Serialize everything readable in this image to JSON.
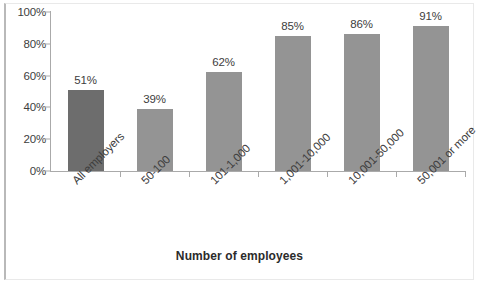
{
  "chart_data": {
    "type": "bar",
    "title": "",
    "xlabel": "Number of employees",
    "ylabel": "",
    "categories": [
      "All employers",
      "50-100",
      "101-1,000",
      "1,001-10,000",
      "10,001-50,000",
      "50,001 or more"
    ],
    "values": [
      51,
      39,
      62,
      85,
      86,
      91
    ],
    "value_labels": [
      "51%",
      "39%",
      "62%",
      "85%",
      "86%",
      "91%"
    ],
    "ylim": [
      0,
      100
    ],
    "ytick_labels": [
      "0%",
      "20%",
      "40%",
      "60%",
      "80%",
      "100%"
    ],
    "ytick_values": [
      0,
      20,
      40,
      60,
      80,
      100
    ],
    "grid": false,
    "legend": "none",
    "series": [
      {
        "name": "Percent",
        "values": [
          51,
          39,
          62,
          85,
          86,
          91
        ]
      }
    ],
    "bar_colors": [
      "#6d6d6d",
      "#949494",
      "#949494",
      "#949494",
      "#949494",
      "#949494"
    ],
    "highlight_category": "All employers"
  },
  "colors": {
    "bar_default": "#949494",
    "bar_highlight": "#6d6d6d",
    "axis": "#aaaaaa",
    "text": "#3d3d3d",
    "frame": "#e9e9e9",
    "background": "#ffffff"
  },
  "axis_title": "Number of employees",
  "page": {
    "caption": ""
  }
}
